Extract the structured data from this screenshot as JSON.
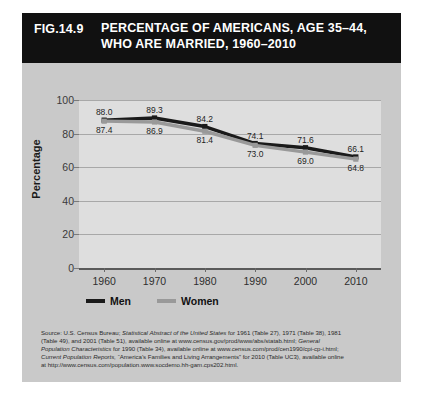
{
  "figure": {
    "number": "FIG.14.9",
    "title_lines": [
      "PERCENTAGE OF AMERICANS, AGE 35–44,",
      "WHO ARE MARRIED, 1960–2010"
    ],
    "title_bg": "#111111",
    "panel_bg": "#c9c9c9",
    "plot_bg": "#dedede"
  },
  "chart_data": {
    "type": "line",
    "title": "PERCENTAGE OF AMERICANS, AGE 35–44, WHO ARE MARRIED, 1960–2010",
    "xlabel": "",
    "ylabel": "Percentage",
    "categories": [
      "1960",
      "1970",
      "1980",
      "1990",
      "2000",
      "2010"
    ],
    "x": [
      1960,
      1970,
      1980,
      1990,
      2000,
      2010
    ],
    "series": [
      {
        "name": "Men",
        "color": "#1a1a1a",
        "marker": "square",
        "values": [
          88.0,
          89.3,
          84.2,
          74.1,
          71.6,
          66.1
        ],
        "labels": [
          "88.0",
          "89.3",
          "84.2",
          "74.1",
          "71.6",
          "66.1"
        ]
      },
      {
        "name": "Women",
        "color": "#999999",
        "marker": "square",
        "values": [
          87.4,
          86.9,
          81.4,
          73.0,
          69.0,
          64.8
        ],
        "labels": [
          "87.4",
          "86.9",
          "81.4",
          "73.0",
          "69.0",
          "64.8"
        ]
      }
    ],
    "ylim": [
      0,
      100
    ],
    "yticks": [
      0,
      20,
      40,
      60,
      80,
      100
    ],
    "ytick_labels": [
      "0",
      "20",
      "40",
      "60",
      "80",
      "100"
    ],
    "xlim": [
      1955,
      2015
    ],
    "grid": true,
    "grid_axis": "y",
    "legend_position": "bottom-left"
  },
  "legend": [
    {
      "label": "Men",
      "color": "#1a1a1a"
    },
    {
      "label": "Women",
      "color": "#999999"
    }
  ],
  "source": {
    "lines": [
      "Source: U.S. Census Bureau; Statistical Abstract of the United States for 1961 (Table 27), 1971 (Table 38), 1981",
      "(Table 49), and 2001 (Table 51), available online at www.census.gov/prod/www/abs/statab.html; General",
      "Population Characteristics for 1990 (Table 34), available online at www.census.com/prod/cen1990/cpi-cp-i.html;",
      "Current Population Reports, “America’s Families and Living Arrangements” for 2010 (Table UC3), available online",
      "at http://www.census.com/population.www.socdemo.hh-gam.cps202.html."
    ],
    "l1_a": "Source: U.S. Census Bureau; ",
    "l1_i": "Statistical Abstract of the United States",
    "l1_b": " for 1961 (Table 27), 1971 (Table 38), 1981",
    "l2_a": "(Table 49), and 2001 (Table 51), available online at www.census.gov/prod/www/abs/statab.html; ",
    "l2_i": "General",
    "l3_i": "Population Characteristics",
    "l3_b": " for 1990 (Table 34), available online at www.census.com/prod/cen1990/cpi-cp-i.html;",
    "l4_i": "Current Population Reports,",
    "l4_b": " “America’s Families and Living Arrangements” for 2010 (Table UC3), available online",
    "l5": "at http://www.census.com/population.www.socdemo.hh-gam.cps202.html."
  }
}
